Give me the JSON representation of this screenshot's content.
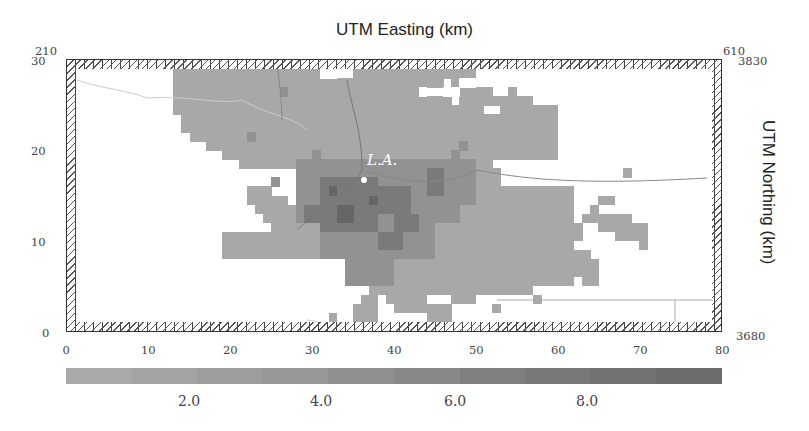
{
  "title": "UTM Easting (km)",
  "right_axis_label": "UTM Northing (km)",
  "corner_labels": {
    "top_left_easting": "210",
    "top_right_easting": "610",
    "top_right_northing": "3830",
    "bottom_right_northing": "3680"
  },
  "x_ticks": [
    "0",
    "10",
    "20",
    "30",
    "40",
    "50",
    "60",
    "70",
    "80"
  ],
  "y_ticks": [
    "30",
    "20",
    "10",
    "0"
  ],
  "colorbar": {
    "ticks": [
      "2.0",
      "4.0",
      "6.0",
      "8.0"
    ],
    "colors": [
      "#a9a9a9",
      "#a3a3a3",
      "#9d9d9d",
      "#979797",
      "#8f8f8f",
      "#888888",
      "#808080",
      "#787878",
      "#727272",
      "#6c6c6c"
    ]
  },
  "city_label": "L.A.",
  "colors": {
    "low": "#a8a8a8",
    "mid": "#929292",
    "high": "#7a7a7a",
    "top": "#666666"
  },
  "map_data": {
    "grid_cols": 80,
    "grid_rows": 30,
    "description": "Gridded concentration field over Los Angeles basin; values shaded grey 0-10, higher near L.A. center"
  }
}
